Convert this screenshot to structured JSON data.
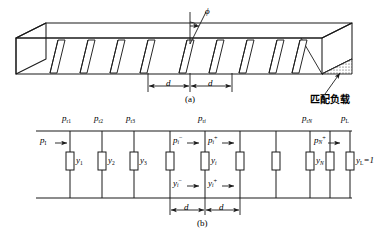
{
  "figure": {
    "title_a": "(a)",
    "title_b": "(b)",
    "matched_load_label": "匹配负载",
    "angle_label": "ϕ",
    "spacing_label": "d"
  },
  "waveguide": {
    "slot_count": 9,
    "slot_tilt_deg": 20,
    "spacing_label_left": "d",
    "spacing_label_right": "d",
    "load_label": "匹配负载"
  },
  "circuit": {
    "input_power_label": "p",
    "input_power_sub": "I",
    "top_node_labels": [
      {
        "base": "p",
        "sub": "r1"
      },
      {
        "base": "p",
        "sub": "r2"
      },
      {
        "base": "p",
        "sub": "r3"
      },
      {
        "base": "p",
        "sub": "ri"
      },
      {
        "base": "p",
        "sub": "rN"
      },
      {
        "base": "p",
        "sub": "L"
      }
    ],
    "power_flow_labels": [
      {
        "base": "p",
        "sub": "i",
        "sup": "−"
      },
      {
        "base": "p",
        "sub": "i",
        "sup": "+"
      },
      {
        "base": "p",
        "sub": "N",
        "sup": "+"
      }
    ],
    "admittance_flow_labels": [
      {
        "base": "y",
        "sub": "i",
        "sup": "−"
      },
      {
        "base": "y",
        "sub": "i",
        "sup": "+"
      }
    ],
    "admittance_labels": [
      {
        "base": "y",
        "sub": "1"
      },
      {
        "base": "y",
        "sub": "2"
      },
      {
        "base": "y",
        "sub": "3"
      },
      {
        "base": "y",
        "sub": "i"
      },
      {
        "base": "y",
        "sub": "N"
      }
    ],
    "load_admittance": {
      "base": "y",
      "sub": "L",
      "value": "= 1"
    },
    "element_count": 10,
    "spacing_label": "d",
    "caption": "(b)"
  },
  "colors": {
    "line": "#1a1a1a",
    "background": "#ffffff",
    "hatch": "#333333"
  }
}
